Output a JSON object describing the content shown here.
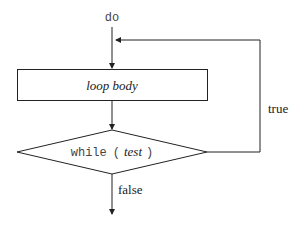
{
  "diagram": {
    "type": "flowchart",
    "start_label": "do",
    "body_label": "loop body",
    "condition": {
      "keyword": "while",
      "open_paren": "(",
      "test": "test",
      "close_paren": ")"
    },
    "true_label": "true",
    "false_label": "false"
  }
}
